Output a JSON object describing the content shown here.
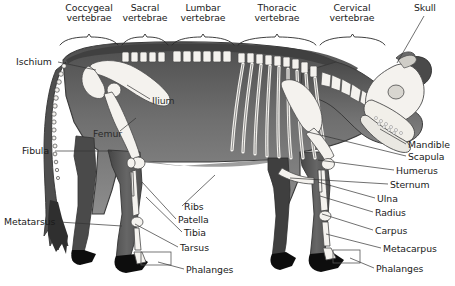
{
  "figure": {
    "view": "left lateral",
    "style": "grayscale scientific illustration"
  },
  "colors": {
    "background": "#ffffff",
    "body_dark": "#595959",
    "body_mid": "#7a7a7a",
    "body_light": "#9a9a9a",
    "bone_fill": "#f4f2ee",
    "bone_outline": "#4a4a4a",
    "hoof": "#111111",
    "leader_line": "#333333",
    "text": "#1a1a1a"
  },
  "top_brackets": [
    {
      "label_line1": "Coccygeal",
      "label_line2": "vertebrae",
      "x_start": 60,
      "x_end": 118,
      "label_cx": 89,
      "label_y": 3
    },
    {
      "label_line1": "Sacral",
      "label_line2": "vertebrae",
      "x_start": 122,
      "x_end": 168,
      "label_cx": 145,
      "label_y": 3
    },
    {
      "label_line1": "Lumbar",
      "label_line2": "vertebrae",
      "x_start": 172,
      "x_end": 234,
      "label_cx": 203,
      "label_y": 3
    },
    {
      "label_line1": "Thoracic",
      "label_line2": "vertebrae",
      "x_start": 238,
      "x_end": 316,
      "label_cx": 277,
      "label_y": 3
    },
    {
      "label_line1": "Cervical",
      "label_line2": "vertebrae",
      "x_start": 320,
      "x_end": 385,
      "label_cx": 352,
      "label_y": 3
    }
  ],
  "labels_left": [
    {
      "text": "Ischium",
      "x": 16,
      "y": 57,
      "leader": [
        [
          58,
          62
        ],
        [
          96,
          70
        ]
      ]
    },
    {
      "text": "Fibula",
      "x": 22,
      "y": 146,
      "leader": [
        [
          55,
          151
        ],
        [
          112,
          151
        ]
      ]
    },
    {
      "text": "Metatarsus",
      "x": 4,
      "y": 217,
      "leader": [
        [
          59,
          222
        ],
        [
          122,
          226
        ]
      ]
    }
  ],
  "labels_on_body": [
    {
      "text": "Ilium",
      "x": 152,
      "y": 96,
      "leader": [
        [
          150,
          99
        ],
        [
          127,
          85
        ]
      ]
    },
    {
      "text": "Femur",
      "x": 93,
      "y": 129,
      "leader": [
        [
          120,
          131
        ],
        [
          136,
          118
        ]
      ]
    }
  ],
  "labels_center": [
    {
      "text": "Ribs",
      "x": 184,
      "y": 202,
      "leader": [
        [
          182,
          206
        ],
        [
          215,
          175
        ]
      ]
    },
    {
      "text": "Patella",
      "x": 178,
      "y": 215,
      "leader": [
        [
          176,
          219
        ],
        [
          142,
          182
        ]
      ]
    },
    {
      "text": "Tibia",
      "x": 184,
      "y": 228,
      "leader": [
        [
          182,
          232
        ],
        [
          146,
          197
        ]
      ]
    },
    {
      "text": "Tarsus",
      "x": 180,
      "y": 243,
      "leader": [
        [
          178,
          247
        ],
        [
          135,
          224
        ]
      ]
    },
    {
      "text": "Phalanges",
      "x": 186,
      "y": 265,
      "leader": [
        [
          184,
          269
        ],
        [
          158,
          262
        ]
      ]
    }
  ],
  "labels_right": [
    {
      "text": "Mandible",
      "x": 408,
      "y": 140,
      "leader": [
        [
          406,
          144
        ],
        [
          380,
          129
        ]
      ]
    },
    {
      "text": "Scapula",
      "x": 408,
      "y": 152,
      "leader": [
        [
          406,
          156
        ],
        [
          308,
          132
        ]
      ]
    },
    {
      "text": "Humerus",
      "x": 396,
      "y": 166,
      "leader": [
        [
          394,
          170
        ],
        [
          318,
          160
        ]
      ]
    },
    {
      "text": "Sternum",
      "x": 390,
      "y": 180,
      "leader": [
        [
          388,
          184
        ],
        [
          290,
          178
        ]
      ]
    },
    {
      "text": "Ulna",
      "x": 377,
      "y": 194,
      "leader": [
        [
          375,
          198
        ],
        [
          318,
          182
        ]
      ]
    },
    {
      "text": "Radius",
      "x": 375,
      "y": 208,
      "leader": [
        [
          373,
          212
        ],
        [
          320,
          196
        ]
      ]
    },
    {
      "text": "Carpus",
      "x": 375,
      "y": 226,
      "leader": [
        [
          373,
          230
        ],
        [
          322,
          214
        ]
      ]
    },
    {
      "text": "Metacarpus",
      "x": 383,
      "y": 244,
      "leader": [
        [
          381,
          248
        ],
        [
          326,
          234
        ]
      ]
    },
    {
      "text": "Phalanges",
      "x": 376,
      "y": 264,
      "leader": [
        [
          374,
          268
        ],
        [
          350,
          258
        ]
      ]
    }
  ],
  "labels_top_right": [
    {
      "text": "Skull",
      "x": 414,
      "y": 3,
      "leader": [
        [
          424,
          16
        ],
        [
          397,
          63
        ]
      ]
    }
  ],
  "callout_boxes": [
    {
      "name": "rear-phalanges-box",
      "x": 141,
      "y": 252,
      "w": 30,
      "h": 13
    },
    {
      "name": "front-phalanges-box",
      "x": 333,
      "y": 250,
      "w": 27,
      "h": 13
    }
  ]
}
